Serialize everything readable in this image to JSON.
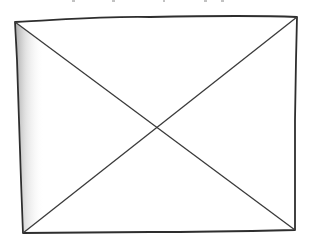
{
  "placeholder": {
    "kind": "image-placeholder",
    "style": "hand-drawn box with X",
    "stroke_color": "#333333",
    "shade_color": "#bdbdbd",
    "background": "#ffffff"
  }
}
